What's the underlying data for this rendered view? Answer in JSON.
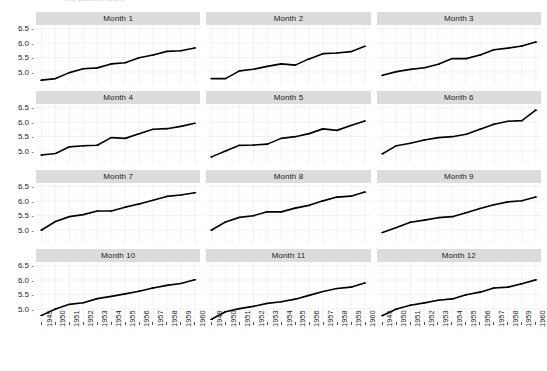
{
  "title_remnant": "log passengers",
  "axis": {
    "y_ticks": [
      "6.5",
      "6.0",
      "5.5",
      "5.0"
    ],
    "y_tick_values": [
      6.5,
      6.0,
      5.5,
      5.0
    ],
    "y_limits": [
      4.55,
      6.62
    ],
    "x_ticks": [
      "1949",
      "1950",
      "1951",
      "1952",
      "1953",
      "1954",
      "1955",
      "1956",
      "1957",
      "1958",
      "1959",
      "1960"
    ],
    "x_tick_values": [
      1949,
      1950,
      1951,
      1952,
      1953,
      1954,
      1955,
      1956,
      1957,
      1958,
      1959,
      1960
    ],
    "x_limits": [
      1948.6,
      1960.4
    ],
    "tick_mark_color": "#4d4d4d",
    "tick_label_color": "#1d1d1d"
  },
  "style": {
    "strip_background": "#dcdcdc",
    "panel_background": "#ffffff",
    "major_gridline": "#ededed",
    "minor_gridline": "#f6f6f6",
    "series_color": "#000000",
    "point_color": "#000000",
    "page_background": "#ffffff"
  },
  "chart_data": {
    "type": "line",
    "title": "",
    "subtitle": "",
    "xlabel": "",
    "ylabel": "",
    "xlim": [
      1948.6,
      1960.4
    ],
    "ylim": [
      4.55,
      6.62
    ],
    "grid": true,
    "legend": "none",
    "facet_layout": {
      "rows": 4,
      "cols": 3,
      "strip_position": "top"
    },
    "x": [
      1949,
      1950,
      1951,
      1952,
      1953,
      1954,
      1955,
      1956,
      1957,
      1958,
      1959,
      1960
    ],
    "series": [
      {
        "name": "Month 1",
        "facet": "Month 1",
        "values": [
          4.718,
          4.771,
          4.977,
          5.111,
          5.141,
          5.278,
          5.318,
          5.489,
          5.583,
          5.71,
          5.733,
          5.828
        ]
      },
      {
        "name": "Month 2",
        "facet": "Month 2",
        "values": [
          4.771,
          4.771,
          5.037,
          5.094,
          5.193,
          5.278,
          5.236,
          5.451,
          5.631,
          5.652,
          5.7,
          5.886
        ]
      },
      {
        "name": "Month 3",
        "facet": "Month 3",
        "values": [
          4.883,
          5.011,
          5.088,
          5.147,
          5.263,
          5.464,
          5.46,
          5.587,
          5.768,
          5.823,
          5.897,
          6.031
        ]
      },
      {
        "name": "Month 4",
        "facet": "Month 4",
        "values": [
          4.86,
          4.913,
          5.142,
          5.182,
          5.198,
          5.46,
          5.434,
          5.595,
          5.749,
          5.769,
          5.849,
          5.955
        ]
      },
      {
        "name": "Month 5",
        "facet": "Month 5",
        "values": [
          4.796,
          4.997,
          5.193,
          5.204,
          5.236,
          5.434,
          5.493,
          5.598,
          5.762,
          5.71,
          5.875,
          6.033
        ]
      },
      {
        "name": "Month 6",
        "facet": "Month 6",
        "values": [
          4.905,
          5.182,
          5.263,
          5.375,
          5.46,
          5.493,
          5.576,
          5.753,
          5.924,
          6.024,
          6.046,
          6.407
        ]
      },
      {
        "name": "Month 7",
        "facet": "Month 7",
        "values": [
          4.997,
          5.293,
          5.46,
          5.529,
          5.652,
          5.652,
          5.787,
          5.897,
          6.024,
          6.157,
          6.206,
          6.286
        ]
      },
      {
        "name": "Month 8",
        "facet": "Month 8",
        "values": [
          4.997,
          5.273,
          5.434,
          5.492,
          5.628,
          5.624,
          5.753,
          5.849,
          6.004,
          6.134,
          6.166,
          6.306
        ]
      },
      {
        "name": "Month 9",
        "facet": "Month 9",
        "values": [
          4.913,
          5.081,
          5.268,
          5.338,
          5.424,
          5.459,
          5.595,
          5.743,
          5.872,
          5.969,
          6.007,
          6.137
        ]
      },
      {
        "name": "Month 10",
        "facet": "Month 10",
        "values": [
          4.779,
          4.997,
          5.159,
          5.214,
          5.356,
          5.433,
          5.521,
          5.613,
          5.724,
          5.814,
          5.88,
          6.009
        ]
      },
      {
        "name": "Month 11",
        "facet": "Month 11",
        "values": [
          4.644,
          4.905,
          5.011,
          5.088,
          5.193,
          5.247,
          5.338,
          5.468,
          5.602,
          5.704,
          5.752,
          5.892
        ]
      },
      {
        "name": "Month 12",
        "facet": "Month 12",
        "values": [
          4.771,
          4.997,
          5.129,
          5.209,
          5.303,
          5.347,
          5.489,
          5.58,
          5.724,
          5.753,
          5.872,
          6.004
        ]
      }
    ]
  },
  "facets": [
    {
      "label": "Month 1"
    },
    {
      "label": "Month 2"
    },
    {
      "label": "Month 3"
    },
    {
      "label": "Month 4"
    },
    {
      "label": "Month 5"
    },
    {
      "label": "Month 6"
    },
    {
      "label": "Month 7"
    },
    {
      "label": "Month 8"
    },
    {
      "label": "Month 9"
    },
    {
      "label": "Month 10"
    },
    {
      "label": "Month 11"
    },
    {
      "label": "Month 12"
    }
  ]
}
